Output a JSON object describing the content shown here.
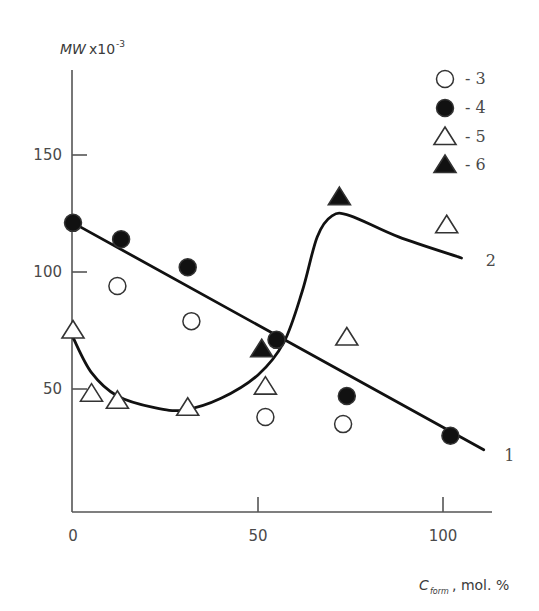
{
  "chart_data": {
    "type": "scatter",
    "title": "",
    "xlabel": "C_form, mol. %",
    "xlabel_main": "C",
    "xlabel_sub": "form",
    "xlabel_rest": ", mol. %",
    "ylabel": "MWx10^-3",
    "ylabel_main": "MW",
    "ylabel_x": "x10",
    "ylabel_exp": "-3",
    "xlim": [
      0,
      115
    ],
    "ylim": [
      0,
      175
    ],
    "x_ticks": [
      0,
      50,
      100
    ],
    "y_ticks": [
      50,
      100,
      150
    ],
    "grid": false,
    "legend_position": "upper right",
    "legend": [
      {
        "marker": "open-circle",
        "label": "- 3"
      },
      {
        "marker": "filled-circle",
        "label": "- 4"
      },
      {
        "marker": "open-triangle",
        "label": "- 5"
      },
      {
        "marker": "filled-triangle",
        "label": "- 6"
      }
    ],
    "series": [
      {
        "name": "3",
        "marker": "open-circle",
        "points": [
          [
            12,
            94
          ],
          [
            32,
            79
          ],
          [
            52,
            38
          ],
          [
            73,
            35
          ]
        ]
      },
      {
        "name": "4",
        "marker": "filled-circle",
        "points": [
          [
            0,
            121
          ],
          [
            13,
            114
          ],
          [
            31,
            102
          ],
          [
            55,
            71
          ],
          [
            74,
            47
          ],
          [
            102,
            30
          ]
        ]
      },
      {
        "name": "5",
        "marker": "open-triangle",
        "points": [
          [
            0,
            75
          ],
          [
            5,
            48
          ],
          [
            12,
            45
          ],
          [
            31,
            42
          ],
          [
            52,
            51
          ],
          [
            74,
            72
          ],
          [
            101,
            120
          ]
        ]
      },
      {
        "name": "6",
        "marker": "filled-triangle",
        "points": [
          [
            51,
            67
          ],
          [
            72,
            132
          ]
        ]
      }
    ],
    "curves": [
      {
        "name": "1",
        "label": "1",
        "type": "line",
        "points": [
          [
            0,
            121
          ],
          [
            111,
            24
          ]
        ]
      },
      {
        "name": "2",
        "label": "2",
        "type": "smooth",
        "points": [
          [
            0,
            72
          ],
          [
            5,
            57
          ],
          [
            12,
            47
          ],
          [
            22,
            42
          ],
          [
            30,
            41
          ],
          [
            40,
            46
          ],
          [
            50,
            56
          ],
          [
            57,
            70
          ],
          [
            62,
            92
          ],
          [
            66,
            115
          ],
          [
            70,
            124
          ],
          [
            75,
            124
          ],
          [
            88,
            115
          ],
          [
            105,
            106
          ]
        ]
      }
    ],
    "annotations": [
      {
        "text": "1",
        "at": [
          116,
          22
        ]
      },
      {
        "text": "2",
        "at": [
          111,
          105
        ]
      }
    ]
  }
}
